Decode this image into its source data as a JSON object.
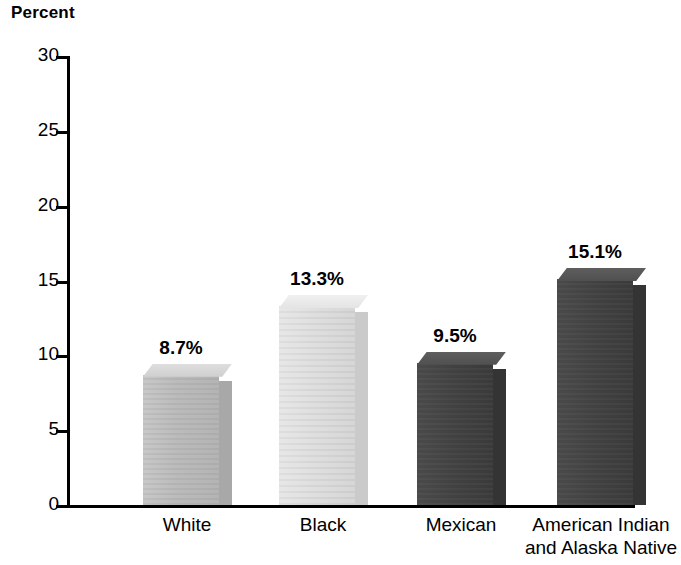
{
  "chart_data": {
    "type": "bar",
    "title": "",
    "ylabel": "Percent",
    "xlabel": "",
    "categories": [
      "White",
      "Black",
      "Mexican",
      "American Indian\nand Alaska Native"
    ],
    "values": [
      8.7,
      13.3,
      9.5,
      15.1
    ],
    "value_labels": [
      "8.7%",
      "9.5%",
      "13.3%",
      "15.1%"
    ],
    "ylim": [
      0,
      30
    ],
    "yticks": [
      0,
      5,
      10,
      15,
      20,
      25,
      30
    ],
    "ytick_labels": [
      "0",
      "5",
      "10",
      "15",
      "20",
      "25",
      "30"
    ],
    "grid": false,
    "legend": false,
    "bars": [
      {
        "category": "White",
        "value": 8.7,
        "label": "8.7%",
        "tone": "tone-medium",
        "color": "#bcbcbc"
      },
      {
        "category": "Black",
        "value": 13.3,
        "label": "13.3%",
        "tone": "tone-light",
        "color": "#dedede"
      },
      {
        "category": "Mexican",
        "value": 9.5,
        "label": "9.5%",
        "tone": "tone-dark",
        "color": "#434343"
      },
      {
        "category": "American Indian\nand Alaska Native",
        "value": 15.1,
        "label": "15.1%",
        "tone": "tone-dark",
        "color": "#434343"
      }
    ]
  },
  "axis": {
    "y_title": "Percent"
  }
}
